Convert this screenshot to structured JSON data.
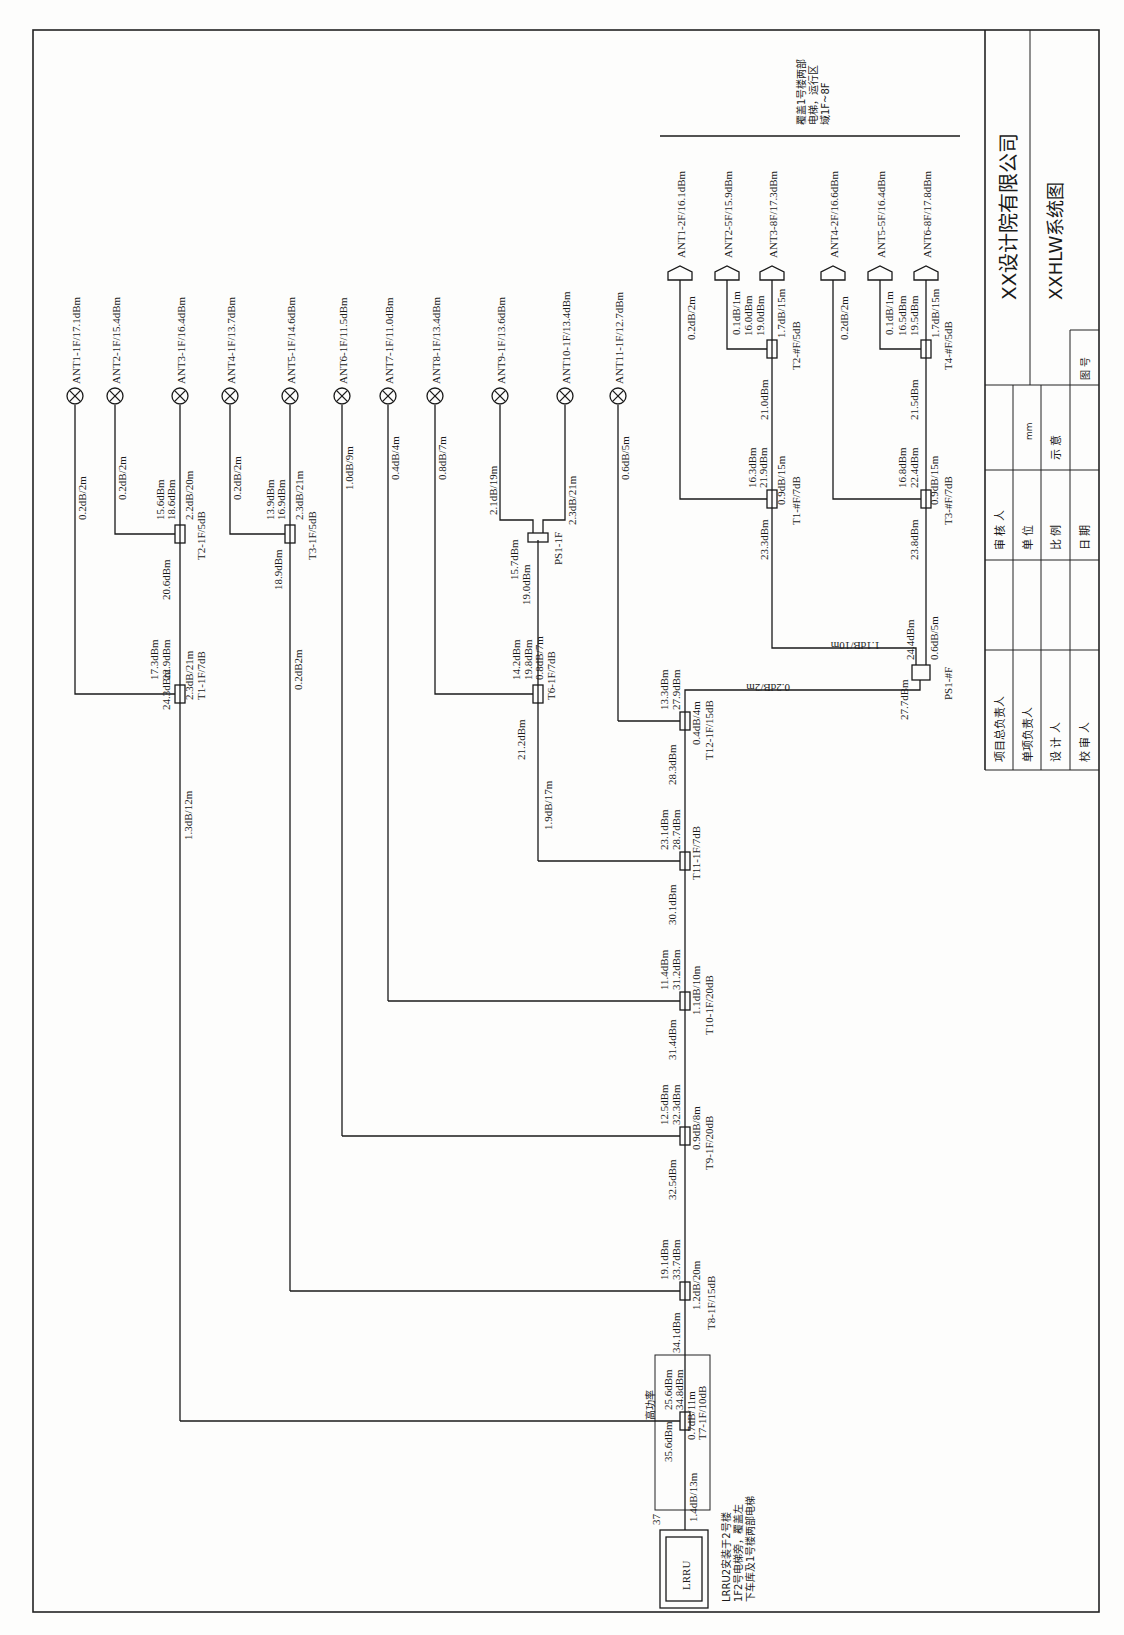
{
  "title_block": {
    "company": "XX设计院有限公司",
    "drawing_title": "XXHLW系统图",
    "rows_left": [
      "项目总负责人",
      "单项负责人",
      "设 计 人",
      "校 审 人"
    ],
    "rows_mid": [
      "审 核 人",
      "单 位",
      "比 例",
      "日 期"
    ],
    "unit_value": "mm",
    "scale_value": "示 意",
    "drawing_no_label": "图 号"
  },
  "coverage_note": "覆盖1号楼两部电梯，运行区域1F~8F",
  "source": {
    "label": "LRRU",
    "port_number": "37",
    "note_lines": [
      "LRRU2安装于2号楼",
      "1F2号电梯旁，覆盖左",
      "下车库及1号楼两部电梯"
    ],
    "high_power_label": "高功率"
  },
  "antennas_1f": [
    {
      "id": "ant1",
      "label": "ANT1-1F/17.1dBm",
      "cable": "0.2dB/2m"
    },
    {
      "id": "ant2",
      "label": "ANT2-1F/15.4dBm",
      "cable": "0.2dB/2m"
    },
    {
      "id": "ant3",
      "label": "ANT3-1F/16.4dBm",
      "cable": "2.2dB/20m"
    },
    {
      "id": "ant4",
      "label": "ANT4-1F/13.7dBm",
      "cable": "0.2dB/2m"
    },
    {
      "id": "ant5",
      "label": "ANT5-1F/14.6dBm",
      "cable": "2.3dB/21m"
    },
    {
      "id": "ant6",
      "label": "ANT6-1F/11.5dBm",
      "cable": "1.0dB/9m"
    },
    {
      "id": "ant7",
      "label": "ANT7-1F/11.0dBm",
      "cable": "0.4dB/4m"
    },
    {
      "id": "ant8",
      "label": "ANT8-1F/13.4dBm",
      "cable": "0.8dB/7m"
    },
    {
      "id": "ant9",
      "label": "ANT9-1F/13.6dBm",
      "cable": "2.1dB/19m"
    },
    {
      "id": "ant10",
      "label": "ANT10-1F/13.4dBm",
      "cable": "2.3dB/21m"
    },
    {
      "id": "ant11",
      "label": "ANT11-1F/12.7dBm",
      "cable": "0.6dB/5m"
    }
  ],
  "antennas_elevator": [
    {
      "id": "e1",
      "label": "ANT1-2F/16.1dBm",
      "cable": "0.2dB/2m"
    },
    {
      "id": "e2",
      "label": "ANT2-5F/15.9dBm",
      "cable": "0.1dB/1m"
    },
    {
      "id": "e3",
      "label": "ANT3-8F/17.3dBm",
      "cable": "1.7dB/15m"
    },
    {
      "id": "e4",
      "label": "ANT4-2F/16.6dBm",
      "cable": "0.2dB/2m"
    },
    {
      "id": "e5",
      "label": "ANT5-5F/16.4dBm",
      "cable": "0.1dB/1m"
    },
    {
      "id": "e6",
      "label": "ANT6-8F/17.8dBm",
      "cable": "1.7dB/15m"
    }
  ],
  "couplers": {
    "T1_1F": {
      "name": "T1-1F/7dB",
      "in": "24.3dBm",
      "cpl": "17.3dBm",
      "out": "22.9dBm",
      "cable": "2.3dB/21m"
    },
    "T2_1F": {
      "name": "T2-1F/5dB",
      "in": "20.6dBm",
      "cpl": "15.6dBm",
      "out": "18.6dBm"
    },
    "T3_1F": {
      "name": "T3-1F/5dB",
      "in": "18.9dBm",
      "cpl": "13.9dBm",
      "out": "16.9dBm"
    },
    "T6_1F": {
      "name": "T6-1F/7dB",
      "in": "21.2dBm",
      "cpl": "14.2dBm",
      "out": "19.8dBm",
      "cable": "0.8dB/7m"
    },
    "PS1_1F": {
      "name": "PS1-1F",
      "in": "19.0dBm",
      "out": "15.7dBm"
    },
    "T7_1F": {
      "name": "T7-1F/10dB",
      "in": "35.6dBm",
      "cpl": "25.6dBm",
      "out": "34.8dBm",
      "cable": "0.7dB/11m"
    },
    "T8_1F": {
      "name": "T8-1F/15dB",
      "in": "34.1dBm",
      "cpl": "19.1dBm",
      "out": "33.7dBm",
      "cable": "1.2dB/20m"
    },
    "T9_1F": {
      "name": "T9-1F/20dB",
      "in": "32.5dBm",
      "cpl": "12.5dBm",
      "out": "32.3dBm",
      "cable": "0.9dB/8m"
    },
    "T10_1F": {
      "name": "T10-1F/20dB",
      "in": "31.4dBm",
      "cpl": "11.4dBm",
      "out": "31.2dBm",
      "cable": "1.1dB/10m"
    },
    "T11_1F": {
      "name": "T11-1F/7dB",
      "in": "30.1dBm",
      "cpl": "23.1dBm",
      "out": "28.7dBm"
    },
    "T12_1F": {
      "name": "T12-1F/15dB",
      "in": "28.3dBm",
      "cpl": "13.3dBm",
      "out": "27.9dBm",
      "cable": "0.4dB/4m"
    },
    "T1_F": {
      "name": "T1-#F/7dB",
      "in": "23.3dBm",
      "cpl": "16.3dBm",
      "out": "21.9dBm",
      "cable": "0.9dB/15m"
    },
    "T2_F": {
      "name": "T2-#F/5dB",
      "in": "21.0dBm",
      "cpl": "16.0dBm",
      "out": "19.0dBm"
    },
    "T3_F": {
      "name": "T3-#F/7dB",
      "in": "23.8dBm",
      "cpl": "16.8dBm",
      "out": "22.4dBm",
      "cable": "0.9dB/15m"
    },
    "T4_F": {
      "name": "T4-#F/5dB",
      "in": "21.5dBm",
      "cpl": "16.5dBm",
      "out": "19.5dBm"
    },
    "PS1_F": {
      "name": "PS1-#F",
      "in": "27.7dBm",
      "out": "24.4dBm",
      "cable_a": "1.1dB/10m",
      "cable_b": "0.6dB/5m"
    }
  },
  "trunk_cables": {
    "lrru_to_t7": "1.4dB/13m",
    "t7_to_t1": "1.3dB/12m",
    "t3_branch": "0.2dB2m",
    "t11_to_t6": "1.9dB/17m",
    "t12_to_ps": "0.2dB/2m"
  }
}
